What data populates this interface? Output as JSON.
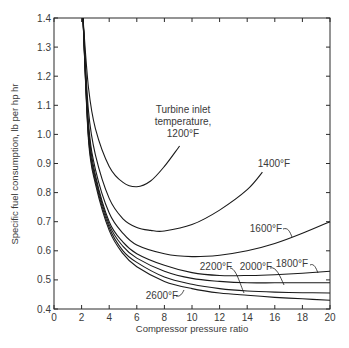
{
  "chart_data": {
    "type": "line",
    "title": "",
    "xlabel": "Compressor pressure ratio",
    "ylabel": "Specific fuel consumption, lb per hp hr",
    "xlim": [
      0,
      20
    ],
    "ylim": [
      0.4,
      1.4
    ],
    "xticks": [
      0,
      2,
      4,
      6,
      8,
      10,
      12,
      14,
      16,
      18,
      20
    ],
    "yticks": [
      0.4,
      0.5,
      0.6,
      0.7,
      0.8,
      0.9,
      1.0,
      1.1,
      1.2,
      1.3,
      1.4
    ],
    "grid": false,
    "legend": "none (curves labeled inline)",
    "annotation_title": [
      "Turbine inlet",
      "temperature,"
    ],
    "series": [
      {
        "name": "1200°F",
        "x": [
          2.1,
          2.5,
          3,
          4,
          5,
          6,
          7,
          8,
          9.1
        ],
        "y": [
          1.4,
          1.16,
          1.02,
          0.89,
          0.835,
          0.82,
          0.84,
          0.89,
          0.96
        ]
      },
      {
        "name": "1400°F",
        "x": [
          2.1,
          2.5,
          3,
          4,
          5,
          6,
          7,
          8,
          10,
          12,
          14,
          15.1
        ],
        "y": [
          1.4,
          1.08,
          0.93,
          0.78,
          0.71,
          0.68,
          0.67,
          0.668,
          0.69,
          0.74,
          0.81,
          0.87
        ]
      },
      {
        "name": "1600°F",
        "x": [
          2.1,
          2.5,
          3,
          4,
          5,
          6,
          8,
          10,
          12,
          14,
          16,
          18,
          20
        ],
        "y": [
          1.4,
          1.04,
          0.88,
          0.73,
          0.66,
          0.62,
          0.59,
          0.58,
          0.585,
          0.6,
          0.625,
          0.66,
          0.7
        ]
      },
      {
        "name": "1800°F",
        "x": [
          2.1,
          2.5,
          3,
          4,
          5,
          6,
          8,
          10,
          12,
          14,
          16,
          18,
          20
        ],
        "y": [
          1.4,
          1.02,
          0.86,
          0.7,
          0.63,
          0.59,
          0.55,
          0.525,
          0.515,
          0.515,
          0.518,
          0.523,
          0.53
        ]
      },
      {
        "name": "2000°F",
        "x": [
          2.1,
          2.5,
          3,
          4,
          5,
          6,
          8,
          10,
          12,
          14,
          16,
          18,
          20
        ],
        "y": [
          1.4,
          1.0,
          0.85,
          0.69,
          0.615,
          0.575,
          0.53,
          0.505,
          0.495,
          0.49,
          0.49,
          0.49,
          0.49
        ]
      },
      {
        "name": "2200°F",
        "x": [
          2.1,
          2.5,
          3,
          4,
          5,
          6,
          8,
          10,
          12,
          14,
          16,
          18,
          20
        ],
        "y": [
          1.4,
          0.99,
          0.84,
          0.68,
          0.6,
          0.56,
          0.51,
          0.485,
          0.47,
          0.462,
          0.458,
          0.456,
          0.455
        ]
      },
      {
        "name": "2600°F",
        "x": [
          2.1,
          2.5,
          3,
          4,
          5,
          6,
          8,
          10,
          12,
          14,
          16,
          18,
          20
        ],
        "y": [
          1.4,
          0.98,
          0.83,
          0.67,
          0.59,
          0.545,
          0.495,
          0.47,
          0.455,
          0.447,
          0.44,
          0.435,
          0.43
        ]
      }
    ]
  },
  "labels": {
    "annot_line1": "Turbine inlet",
    "annot_line2": "temperature,",
    "t1200": "1200°F",
    "t1400": "1400°F",
    "t1600": "1600°F",
    "t1800": "1800°F",
    "t2000": "2000°F",
    "t2200": "2200°F",
    "t2600": "2600°F"
  }
}
